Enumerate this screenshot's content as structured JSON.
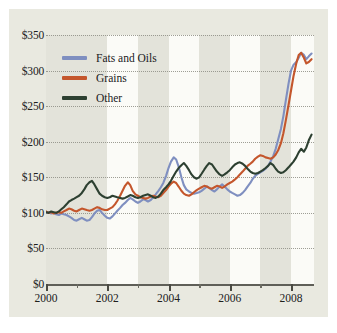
{
  "chart_data": {
    "type": "line",
    "title": "",
    "xlabel": "",
    "ylabel": "",
    "xlim": [
      2000,
      2008.75
    ],
    "ylim": [
      0,
      350
    ],
    "grid": true,
    "legend_position": "top-left inside",
    "y_ticks": [
      0,
      50,
      100,
      150,
      200,
      250,
      300,
      350
    ],
    "y_tick_labels": [
      "$0",
      "$50",
      "$100",
      "$150",
      "$200",
      "$250",
      "$300",
      "$350"
    ],
    "x_ticks": [
      2000,
      2001,
      2002,
      2003,
      2004,
      2005,
      2006,
      2007,
      2008
    ],
    "x_tick_labels": [
      "2000",
      "",
      "2002",
      "",
      "2004",
      "",
      "2006",
      "",
      "2008"
    ],
    "x_major_ticks": [
      2000,
      2002,
      2004,
      2006,
      2008
    ],
    "x_minor_ticks": [
      2001,
      2003,
      2005,
      2007
    ],
    "colors": {
      "fats_and_oils": "#7f8fc0",
      "grains": "#c4562c",
      "other": "#2d4031",
      "background": "#e9e9e0",
      "band_light": "#fbfbf7",
      "gridline": "#8e8e85",
      "axis": "#5f5f58",
      "text": "#20201c"
    },
    "shaded_bands": [
      {
        "from": 2000.0,
        "to": 2001.0,
        "shade": "dark"
      },
      {
        "from": 2001.0,
        "to": 2002.0,
        "shade": "dark"
      },
      {
        "from": 2002.0,
        "to": 2003.0,
        "shade": "light"
      },
      {
        "from": 2003.0,
        "to": 2004.0,
        "shade": "dark"
      },
      {
        "from": 2004.0,
        "to": 2005.0,
        "shade": "light"
      },
      {
        "from": 2005.0,
        "to": 2006.0,
        "shade": "dark"
      },
      {
        "from": 2006.0,
        "to": 2007.0,
        "shade": "light"
      },
      {
        "from": 2007.0,
        "to": 2008.0,
        "shade": "dark"
      },
      {
        "from": 2008.0,
        "to": 2008.75,
        "shade": "light"
      }
    ],
    "x": [
      2000.0,
      2000.08,
      2000.17,
      2000.25,
      2000.33,
      2000.42,
      2000.5,
      2000.58,
      2000.67,
      2000.75,
      2000.83,
      2000.92,
      2001.0,
      2001.08,
      2001.17,
      2001.25,
      2001.33,
      2001.42,
      2001.5,
      2001.58,
      2001.67,
      2001.75,
      2001.83,
      2001.92,
      2002.0,
      2002.08,
      2002.17,
      2002.25,
      2002.33,
      2002.42,
      2002.5,
      2002.58,
      2002.67,
      2002.75,
      2002.83,
      2002.92,
      2003.0,
      2003.08,
      2003.17,
      2003.25,
      2003.33,
      2003.42,
      2003.5,
      2003.58,
      2003.67,
      2003.75,
      2003.83,
      2003.92,
      2004.0,
      2004.08,
      2004.17,
      2004.25,
      2004.33,
      2004.42,
      2004.5,
      2004.58,
      2004.67,
      2004.75,
      2004.83,
      2004.92,
      2005.0,
      2005.08,
      2005.17,
      2005.25,
      2005.33,
      2005.42,
      2005.5,
      2005.58,
      2005.67,
      2005.75,
      2005.83,
      2005.92,
      2006.0,
      2006.08,
      2006.17,
      2006.25,
      2006.33,
      2006.42,
      2006.5,
      2006.58,
      2006.67,
      2006.75,
      2006.83,
      2006.92,
      2007.0,
      2007.08,
      2007.17,
      2007.25,
      2007.33,
      2007.42,
      2007.5,
      2007.58,
      2007.67,
      2007.75,
      2007.83,
      2007.92,
      2008.0,
      2008.08,
      2008.17,
      2008.25,
      2008.33,
      2008.42,
      2008.5,
      2008.58,
      2008.67
    ],
    "series": [
      {
        "name": "Fats and Oils",
        "color": "#7f8fc0",
        "values": [
          100,
          101,
          99,
          100,
          98,
          97,
          99,
          98,
          97,
          95,
          93,
          90,
          89,
          91,
          93,
          91,
          89,
          90,
          94,
          99,
          103,
          104,
          100,
          96,
          93,
          92,
          95,
          99,
          103,
          107,
          111,
          114,
          118,
          121,
          119,
          116,
          114,
          116,
          119,
          118,
          116,
          118,
          122,
          126,
          131,
          136,
          142,
          152,
          163,
          172,
          178,
          175,
          165,
          150,
          139,
          133,
          130,
          128,
          127,
          128,
          129,
          131,
          134,
          137,
          135,
          132,
          130,
          133,
          137,
          140,
          137,
          133,
          130,
          128,
          126,
          124,
          125,
          128,
          132,
          137,
          142,
          148,
          152,
          155,
          157,
          159,
          162,
          166,
          172,
          180,
          190,
          203,
          218,
          236,
          258,
          282,
          300,
          308,
          312,
          318,
          325,
          322,
          316,
          320,
          324
        ]
      },
      {
        "name": "Grains",
        "color": "#c4562c",
        "values": [
          102,
          100,
          101,
          99,
          100,
          101,
          100,
          102,
          104,
          106,
          105,
          103,
          102,
          104,
          106,
          105,
          104,
          103,
          104,
          106,
          108,
          107,
          105,
          104,
          104,
          106,
          108,
          112,
          117,
          124,
          131,
          138,
          143,
          139,
          131,
          126,
          124,
          122,
          121,
          120,
          121,
          123,
          124,
          123,
          122,
          124,
          128,
          132,
          137,
          141,
          144,
          142,
          137,
          131,
          127,
          125,
          124,
          126,
          129,
          132,
          134,
          136,
          138,
          137,
          135,
          134,
          136,
          138,
          137,
          135,
          137,
          140,
          142,
          144,
          147,
          150,
          154,
          158,
          162,
          166,
          169,
          172,
          176,
          179,
          181,
          180,
          178,
          177,
          176,
          178,
          182,
          188,
          198,
          212,
          230,
          252,
          272,
          292,
          310,
          322,
          325,
          318,
          310,
          312,
          316
        ]
      },
      {
        "name": "Other",
        "color": "#2d4031",
        "values": [
          101,
          100,
          102,
          101,
          100,
          102,
          105,
          108,
          112,
          116,
          118,
          120,
          122,
          124,
          128,
          133,
          139,
          143,
          145,
          140,
          133,
          127,
          124,
          122,
          121,
          122,
          124,
          123,
          122,
          121,
          120,
          121,
          123,
          125,
          124,
          122,
          121,
          122,
          124,
          125,
          126,
          124,
          122,
          121,
          123,
          127,
          132,
          136,
          140,
          145,
          152,
          158,
          163,
          167,
          170,
          166,
          160,
          154,
          150,
          148,
          150,
          155,
          161,
          166,
          170,
          168,
          163,
          158,
          154,
          152,
          154,
          157,
          160,
          164,
          168,
          170,
          171,
          169,
          166,
          162,
          158,
          156,
          155,
          156,
          158,
          160,
          163,
          166,
          170,
          167,
          162,
          158,
          156,
          157,
          160,
          164,
          168,
          172,
          178,
          185,
          190,
          186,
          192,
          202,
          210
        ]
      }
    ]
  },
  "legend": {
    "entries": [
      {
        "label": "Fats and Oils",
        "color": "#7f8fc0"
      },
      {
        "label": "Grains",
        "color": "#c4562c"
      },
      {
        "label": "Other",
        "color": "#2d4031"
      }
    ]
  }
}
